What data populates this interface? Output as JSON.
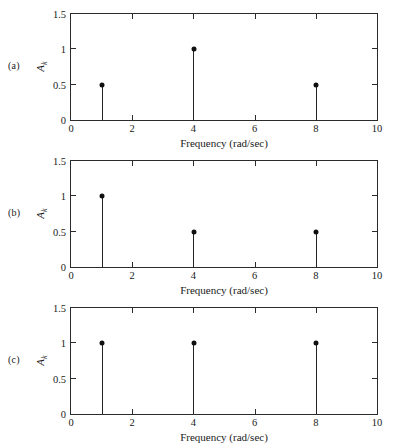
{
  "figure": {
    "background": "#ffffff",
    "axis_color": "#2b2b2b",
    "stem_color": "#232323",
    "marker_color": "#101010"
  },
  "panels": [
    {
      "tag": "(a)",
      "xlabel": "Frequency (rad/sec)",
      "ylabel_main": "A",
      "ylabel_sub": "k"
    },
    {
      "tag": "(b)",
      "xlabel": "Frequency (rad/sec)",
      "ylabel_main": "A",
      "ylabel_sub": "k"
    },
    {
      "tag": "(c)",
      "xlabel": "Frequency (rad/sec)",
      "ylabel_main": "A",
      "ylabel_sub": "k"
    }
  ],
  "xticklabels": [
    "0",
    "2",
    "4",
    "6",
    "8",
    "10"
  ],
  "yticklabels": [
    "0",
    "0.5",
    "1",
    "1.5"
  ],
  "chart_data": [
    {
      "type": "bar",
      "panel": "(a)",
      "title": "",
      "xlabel": "Frequency (rad/sec)",
      "ylabel": "A_k",
      "xlim": [
        0,
        10
      ],
      "ylim": [
        0,
        1.5
      ],
      "xticks": [
        0,
        2,
        4,
        6,
        8,
        10
      ],
      "yticks": [
        0,
        0.5,
        1,
        1.5
      ],
      "grid": false,
      "legend": "none",
      "style": "stem",
      "x": [
        1,
        4,
        8
      ],
      "values": [
        0.5,
        1.0,
        0.5
      ]
    },
    {
      "type": "bar",
      "panel": "(b)",
      "title": "",
      "xlabel": "Frequency (rad/sec)",
      "ylabel": "A_k",
      "xlim": [
        0,
        10
      ],
      "ylim": [
        0,
        1.5
      ],
      "xticks": [
        0,
        2,
        4,
        6,
        8,
        10
      ],
      "yticks": [
        0,
        0.5,
        1,
        1.5
      ],
      "grid": false,
      "legend": "none",
      "style": "stem",
      "x": [
        1,
        4,
        8
      ],
      "values": [
        1.0,
        0.5,
        0.5
      ]
    },
    {
      "type": "bar",
      "panel": "(c)",
      "title": "",
      "xlabel": "Frequency (rad/sec)",
      "ylabel": "A_k",
      "xlim": [
        0,
        10
      ],
      "ylim": [
        0,
        1.5
      ],
      "xticks": [
        0,
        2,
        4,
        6,
        8,
        10
      ],
      "yticks": [
        0,
        0.5,
        1,
        1.5
      ],
      "grid": false,
      "legend": "none",
      "style": "stem",
      "x": [
        1,
        4,
        8
      ],
      "values": [
        1.0,
        1.0,
        1.0
      ]
    }
  ]
}
